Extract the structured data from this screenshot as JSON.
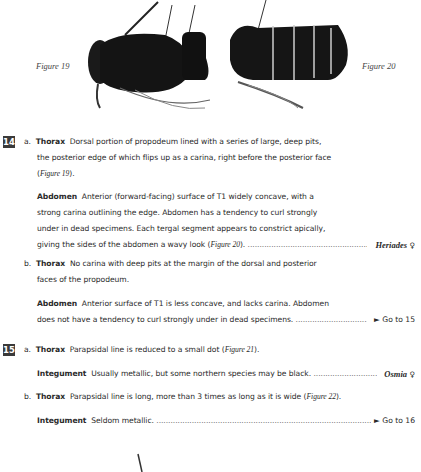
{
  "figures": {
    "fig19_caption": "Figure 19",
    "fig20_caption": "Figure 20"
  },
  "couplets": [
    {
      "number": "14",
      "a": {
        "letter": "a.",
        "thorax_label": "Thorax",
        "thorax_lines": [
          "Dorsal portion of propodeum lined with a series of large, deep pits,",
          "the posterior edge of which flips up as a carina, right before the posterior face"
        ],
        "thorax_fig_ref": "Figure 19",
        "abdomen_label": "Abdomen",
        "abdomen_lines": [
          "Anterior (forward-facing) surface of T1 widely concave, with a",
          "strong carina outlining the edge. Abdomen has a tendency to curl strongly",
          "under in dead specimens. Each tergal segment appears to constrict apically,",
          "giving the sides of the abdomen a wavy look ("
        ],
        "abdomen_fig_ref": "Figure 20",
        "result_genus": "Heriades",
        "result_sex": "♀"
      },
      "b": {
        "letter": "b.",
        "thorax_label": "Thorax",
        "thorax_lines": [
          "No carina with deep pits at the margin of the dorsal and posterior",
          "faces of the propodeum."
        ],
        "abdomen_label": "Abdomen",
        "abdomen_lines": [
          "Anterior surface of T1 is less concave, and lacks carina. Abdomen",
          "does not have a tendency to curl strongly under in dead specimens."
        ],
        "result": "► Go to 15"
      }
    },
    {
      "number": "15",
      "a": {
        "letter": "a.",
        "thorax_label": "Thorax",
        "thorax_text": "Parapsidal line is reduced to a small dot (",
        "thorax_fig_ref": "Figure 21",
        "integument_label": "Integument",
        "integument_text": "Usually metallic, but some northern species may be black.",
        "result_genus": "Osmia",
        "result_sex": "♀"
      },
      "b": {
        "letter": "b.",
        "thorax_label": "Thorax",
        "thorax_text": "Parapsidal line is long, more than 3 times as long as it is wide (",
        "thorax_fig_ref": "Figure 22",
        "integument_label": "Integument",
        "integument_text": "Seldom metallic.",
        "result": "► Go to 16"
      }
    }
  ],
  "dots": "............................................................................................................"
}
